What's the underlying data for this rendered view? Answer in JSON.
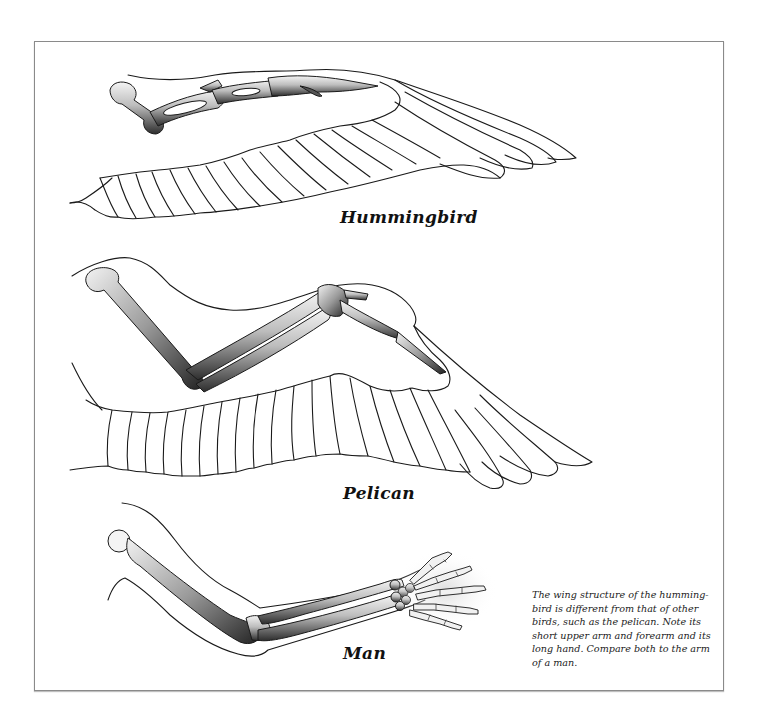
{
  "figure": {
    "type": "comparative anatomy illustration",
    "panels": [
      {
        "id": "hummingbird",
        "label": "Hummingbird",
        "subject": "hummingbird wing skeleton with feathers"
      },
      {
        "id": "pelican",
        "label": "Pelican",
        "subject": "pelican wing skeleton with feathers"
      },
      {
        "id": "man",
        "label": "Man",
        "subject": "human arm skeleton with hand"
      }
    ],
    "caption": "The wing structure of the humming-bird is different from that of other birds, such as the pelican. Note its short upper arm and forearm and its long hand. Compare both to the arm of a man.",
    "colors": {
      "background": "#ffffff",
      "frame_border": "#8a8a8a",
      "line": "#1a1a1a",
      "bone_shadow": "#3a3a3a",
      "bone_light": "#e8e8e8"
    }
  }
}
